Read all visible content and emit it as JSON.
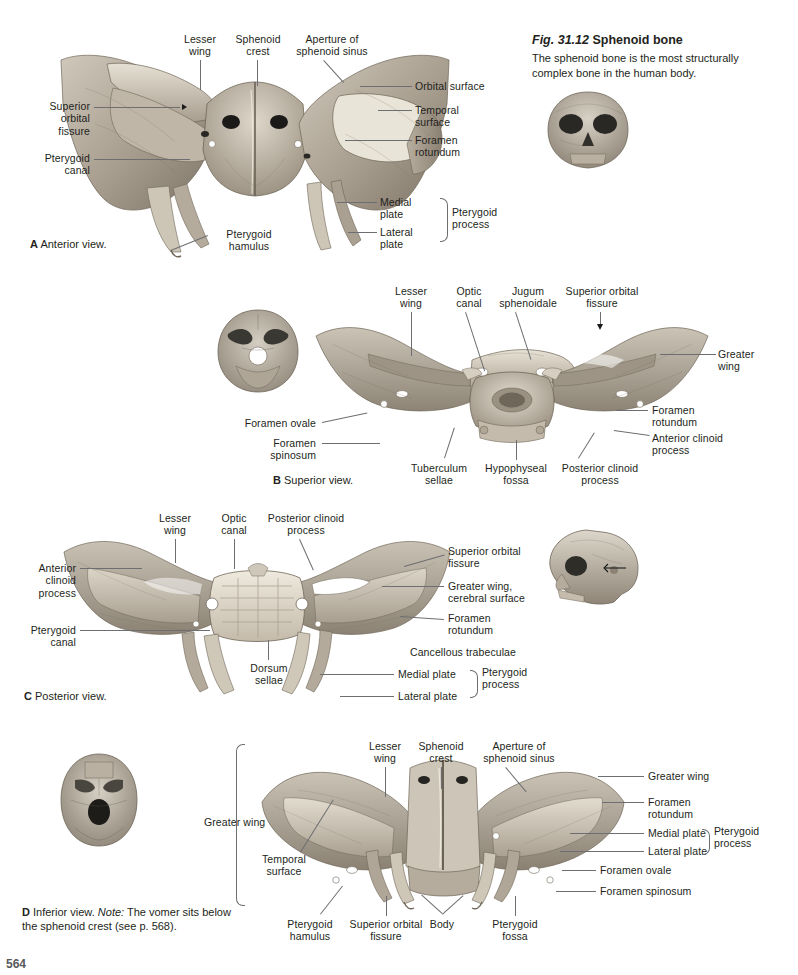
{
  "figure": {
    "number": "Fig. 31.12",
    "title": "Sphenoid bone",
    "description": "The sphenoid bone is the most structurally complex bone in the human body."
  },
  "page_number": "564",
  "panels": {
    "a": {
      "letter": "A",
      "caption": "Anterior view.",
      "labels": {
        "lesser_wing": "Lesser\nwing",
        "sphenoid_crest": "Sphenoid\ncrest",
        "aperture_of_sphenoid_sinus": "Aperture of\nsphenoid sinus",
        "orbital_surface": "Orbital surface",
        "temporal_surface": "Temporal\nsurface",
        "foramen_rotundum": "Foramen\nrotundum",
        "superior_orbital_fissure": "Superior\norbital\nfissure",
        "pterygoid_canal": "Pterygoid\ncanal",
        "pterygoid_hamulus": "Pterygoid\nhamulus",
        "medial_plate": "Medial\nplate",
        "lateral_plate": "Lateral\nplate",
        "pterygoid_process": "Pterygoid\nprocess"
      }
    },
    "b": {
      "letter": "B",
      "caption": "Superior view.",
      "labels": {
        "lesser_wing": "Lesser\nwing",
        "optic_canal": "Optic\ncanal",
        "jugum_sphenoidale": "Jugum\nsphenoidale",
        "superior_orbital_fissure": "Superior orbital\nfissure",
        "greater_wing": "Greater\nwing",
        "foramen_rotundum": "Foramen\nrotundum",
        "anterior_clinoid_process": "Anterior clinoid\nprocess",
        "foramen_ovale": "Foramen ovale",
        "foramen_spinosum": "Foramen\nspinosum",
        "tuberculum_sellae": "Tuberculum\nsellae",
        "hypophyseal_fossa": "Hypophyseal\nfossa",
        "posterior_clinoid_process": "Posterior clinoid\nprocess"
      }
    },
    "c": {
      "letter": "C",
      "caption": "Posterior view.",
      "labels": {
        "lesser_wing": "Lesser\nwing",
        "optic_canal": "Optic\ncanal",
        "posterior_clinoid_process": "Posterior clinoid\nprocess",
        "superior_orbital_fissure": "Superior orbital\nfissure",
        "greater_wing_cerebral_surface": "Greater wing,\ncerebral surface",
        "foramen_rotundum": "Foramen\nrotundum",
        "cancellous_trabeculae": "Cancellous trabeculae",
        "medial_plate": "Medial plate",
        "lateral_plate": "Lateral plate",
        "pterygoid_process": "Pterygoid\nprocess",
        "anterior_clinoid_process": "Anterior\nclinoid\nprocess",
        "pterygoid_canal": "Pterygoid\ncanal",
        "dorsum_sellae": "Dorsum\nsellae"
      }
    },
    "d": {
      "letter": "D",
      "caption_text": "Inferior view. ",
      "caption_note_label": "Note:",
      "caption_note": " The vomer sits below the sphenoid crest (see p. 568).",
      "labels": {
        "lesser_wing": "Lesser\nwing",
        "sphenoid_crest": "Sphenoid\ncrest",
        "aperture_of_sphenoid_sinus": "Aperture of\nsphenoid sinus",
        "greater_wing_right": "Greater wing",
        "foramen_rotundum": "Foramen\nrotundum",
        "medial_plate": "Medial plate",
        "lateral_plate": "Lateral plate",
        "pterygoid_process": "Pterygoid\nprocess",
        "foramen_ovale": "Foramen ovale",
        "foramen_spinosum": "Foramen spinosum",
        "greater_wing_left": "Greater wing",
        "temporal_surface": "Temporal\nsurface",
        "pterygoid_hamulus": "Pterygoid\nhamulus",
        "superior_orbital_fissure": "Superior orbital\nfissure",
        "body": "Body",
        "pterygoid_fossa": "Pterygoid\nfossa"
      }
    }
  },
  "colors": {
    "text": "#231f20",
    "leader": "#6d6e71",
    "bone_light": "#d9d3c8",
    "bone_mid": "#b3aa9c",
    "bone_dark": "#7d756a",
    "background": "#ffffff"
  }
}
